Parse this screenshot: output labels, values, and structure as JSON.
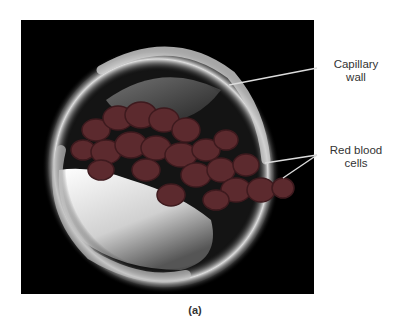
{
  "figure": {
    "caption": "(a)",
    "labels": [
      {
        "id": "capillary-wall",
        "line1": "Capillary",
        "line2": "wall"
      },
      {
        "id": "red-blood-cells",
        "line1": "Red blood",
        "line2": "cells"
      }
    ],
    "colors": {
      "background": "#000000",
      "rbc": "#5c2a2e",
      "rbc_dark": "#3e1a1e",
      "wall": "#d9d9d9",
      "leader_line": "#dcdcdc"
    }
  }
}
